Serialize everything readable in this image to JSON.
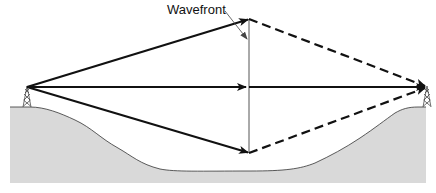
{
  "diagram": {
    "title_label": "Wavefront",
    "colors": {
      "ground_fill": "#d9d9d9",
      "ground_stroke": "#333333",
      "ray": "#111111",
      "wavefront_line": "#555555",
      "leader": "#444444"
    },
    "elements": {
      "transmitter": {
        "name": "transmitter-tower",
        "x": 27,
        "y": 87
      },
      "receiver": {
        "name": "receiver-tower",
        "x": 427,
        "y": 87
      },
      "wavefront": {
        "x": 249,
        "y_top": 19,
        "y_bottom": 153
      },
      "rays": [
        {
          "name": "upper-ray",
          "from": [
            27,
            87
          ],
          "to": [
            249,
            19
          ],
          "style": "solid",
          "then_to": [
            427,
            87
          ],
          "then_style": "dashed"
        },
        {
          "name": "direct-ray",
          "from": [
            27,
            87
          ],
          "to": [
            249,
            87
          ],
          "style": "solid",
          "then_to": [
            427,
            87
          ],
          "then_style": "solid"
        },
        {
          "name": "lower-ray",
          "from": [
            27,
            87
          ],
          "to": [
            249,
            153
          ],
          "style": "solid",
          "then_to": [
            427,
            87
          ],
          "then_style": "dashed"
        }
      ]
    }
  }
}
